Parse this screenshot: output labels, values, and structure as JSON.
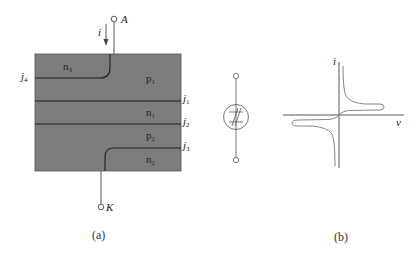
{
  "figure_a": {
    "caption": "(a)",
    "anode_label": "A",
    "cathode_label": "K",
    "current_label": "i",
    "regions": {
      "n3": "n",
      "n3_sub": "3",
      "p1": "p",
      "p1_sub": "1",
      "n1": "n",
      "n1_sub": "1",
      "p2": "p",
      "p2_sub": "2",
      "n2": "n",
      "n2_sub": "2"
    },
    "junctions": {
      "j1": "j",
      "j1_sub": "1",
      "j2": "j",
      "j2_sub": "2",
      "j3": "j",
      "j3_sub": "3",
      "j4": "j",
      "j4_sub": "4"
    },
    "colors": {
      "silicon_fill": "#7d7d7d",
      "junction_line": "#2a2a2a"
    }
  },
  "symbol": {
    "name": "bidirectional-thyristor-symbol"
  },
  "figure_b": {
    "caption": "(b)",
    "y_axis_label": "i",
    "x_axis_label": "v"
  }
}
